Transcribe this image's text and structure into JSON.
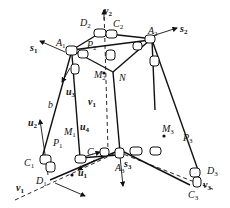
{
  "diagram": {
    "type": "parallel mechanism kinematic diagram (3-branch linkage with joints)",
    "colors": {
      "line": "#111111",
      "background": "#ffffff"
    },
    "labels": {
      "A1": {
        "base": "A",
        "sub": "1"
      },
      "A2": {
        "base": "A",
        "sub": "2"
      },
      "A3": {
        "base": "A",
        "sub": "3"
      },
      "C1": {
        "base": "C",
        "sub": "1"
      },
      "C2": {
        "base": "C",
        "sub": "2"
      },
      "C3": {
        "base": "C",
        "sub": "3"
      },
      "D1": {
        "base": "D",
        "sub": "1"
      },
      "D2": {
        "base": "D",
        "sub": "2"
      },
      "D3": {
        "base": "D",
        "sub": "3"
      },
      "P1": {
        "base": "P",
        "sub": "1"
      },
      "P2": {
        "base": "P",
        "sub": "2"
      },
      "P3": {
        "base": "P",
        "sub": "3"
      },
      "M1": {
        "base": "M",
        "sub": "1"
      },
      "M2": {
        "base": "M",
        "sub": "2"
      },
      "M3": {
        "base": "M",
        "sub": "3"
      },
      "N": {
        "base": "N",
        "sub": ""
      },
      "b": {
        "base": "b",
        "sub": ""
      },
      "C": {
        "base": "C",
        "sub": ""
      },
      "s1": {
        "base": "s",
        "sub": "1"
      },
      "s2": {
        "base": "s",
        "sub": "2"
      },
      "s3": {
        "base": "s",
        "sub": "3"
      },
      "u1": {
        "base": "u",
        "sub": "1"
      },
      "u2": {
        "base": "u",
        "sub": "2"
      },
      "u3": {
        "base": "u",
        "sub": "3"
      },
      "u4": {
        "base": "u",
        "sub": "4"
      },
      "v1": {
        "base": "v",
        "sub": "1"
      },
      "v2": {
        "base": "v",
        "sub": "2"
      },
      "v3": {
        "base": "v",
        "sub": "3"
      }
    }
  }
}
